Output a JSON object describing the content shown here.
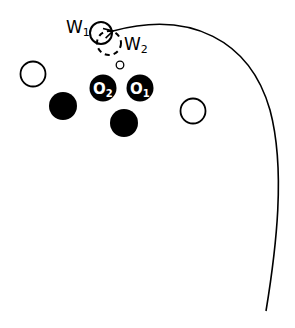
{
  "diagram": {
    "labels": {
      "w1": "W",
      "w1_sub": "1",
      "w2": "W",
      "w2_sub": "2",
      "o1": "O",
      "o1_sub": "1",
      "o2": "O",
      "o2_sub": "2"
    },
    "colors": {
      "stroke": "#000000",
      "fill_dark": "#000000",
      "background": "#ffffff"
    },
    "elements": [
      {
        "id": "w1-circle",
        "type": "solid-outline-circle"
      },
      {
        "id": "w2-circle",
        "type": "dashed-outline-circle"
      },
      {
        "id": "small-circle",
        "type": "small-outline-circle"
      },
      {
        "id": "open-circle-left",
        "type": "outline-circle"
      },
      {
        "id": "open-circle-right",
        "type": "outline-circle"
      },
      {
        "id": "o2-circle",
        "type": "filled-labeled-circle"
      },
      {
        "id": "o1-circle",
        "type": "filled-labeled-circle"
      },
      {
        "id": "filled-circle-left",
        "type": "filled-circle"
      },
      {
        "id": "filled-circle-center",
        "type": "filled-circle"
      },
      {
        "id": "trajectory-arrow",
        "type": "curved-arrow"
      }
    ]
  }
}
